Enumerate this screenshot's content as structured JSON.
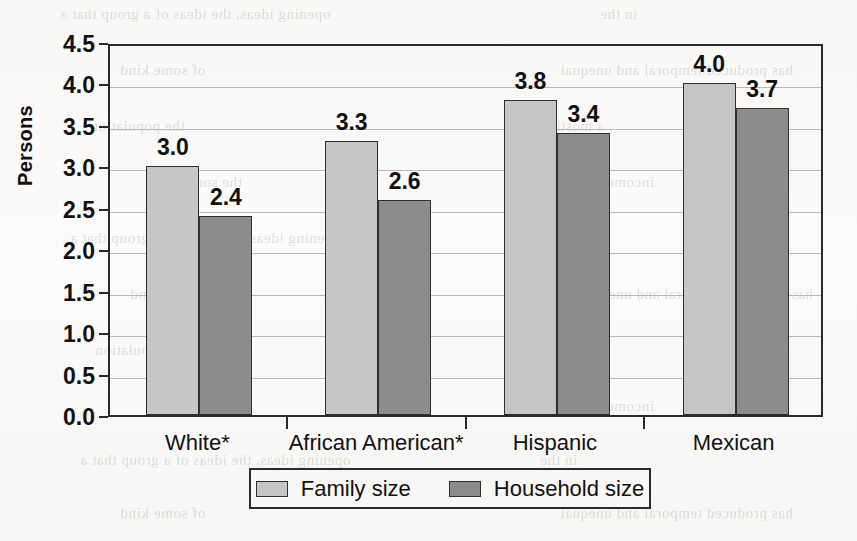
{
  "chart_data": {
    "type": "bar",
    "title": "",
    "subtitle": "",
    "xlabel": "",
    "ylabel": "Persons",
    "ylim": [
      0.0,
      4.5
    ],
    "ytick_step": 0.5,
    "grid": true,
    "legend_position": "bottom",
    "categories": [
      "White*",
      "African American*",
      "Hispanic",
      "Mexican"
    ],
    "series": [
      {
        "name": "Family size",
        "color": "#c6c6c6",
        "values": [
          3.0,
          3.3,
          3.8,
          4.0
        ],
        "labels": [
          "3.0",
          "3.3",
          "3.8",
          "4.0"
        ]
      },
      {
        "name": "Household size",
        "color": "#8c8c8c",
        "values": [
          2.4,
          2.6,
          3.4,
          3.7
        ],
        "labels": [
          "2.4",
          "2.6",
          "3.4",
          "3.7"
        ]
      }
    ],
    "ytick_labels": [
      "0.0",
      "0.5",
      "1.0",
      "1.5",
      "2.0",
      "2.5",
      "3.0",
      "3.5",
      "4.0",
      "4.5"
    ],
    "ytick_values": [
      0.0,
      0.5,
      1.0,
      1.5,
      2.0,
      2.5,
      3.0,
      3.5,
      4.0,
      4.5
    ]
  },
  "axes": {
    "y_title": "Persons"
  },
  "legend": {
    "items": [
      {
        "label": "Family size",
        "swatch": "light-gray-swatch"
      },
      {
        "label": "Household size",
        "swatch": "dark-gray-swatch"
      }
    ]
  },
  "background_ghost_text": [
    "opening ideas, the ideas of a group that a",
    "in the",
    "of some kind",
    "has produced temporal and unequal",
    "the population",
    "a mostly and",
    "the some with",
    "incomes"
  ]
}
